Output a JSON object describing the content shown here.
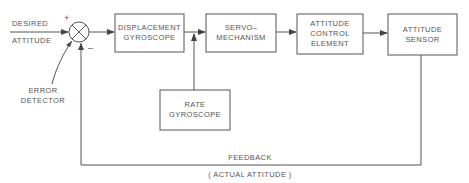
{
  "diagram": {
    "type": "block-diagram",
    "input": {
      "line1": "DESIRED",
      "line2": "ATTITUDE"
    },
    "junction": {
      "plus": "+",
      "minus": "–",
      "label_line1": "ERROR",
      "label_line2": "DETECTOR"
    },
    "blocks": [
      {
        "id": "displacement-gyroscope",
        "line1": "DISPLACEMENT",
        "line2": "GYROSCOPE"
      },
      {
        "id": "servo-mechanism",
        "line1": "SERVO–",
        "line2": "MECHANISM"
      },
      {
        "id": "attitude-control-element",
        "line1": "ATTITUDE",
        "line2": "CONTROL",
        "line3": "ELEMENT"
      },
      {
        "id": "attitude-sensor",
        "line1": "ATTITUDE",
        "line2": "SENSOR"
      },
      {
        "id": "rate-gyroscope",
        "line1": "RATE",
        "line2": "GYROSCOPE"
      }
    ],
    "feedback": {
      "label": "FEEDBACK",
      "sublabel": "( ACTUAL  ATTITUDE )"
    },
    "colors": {
      "line": "#555555",
      "text": "#555555",
      "background": "#ffffff"
    }
  }
}
